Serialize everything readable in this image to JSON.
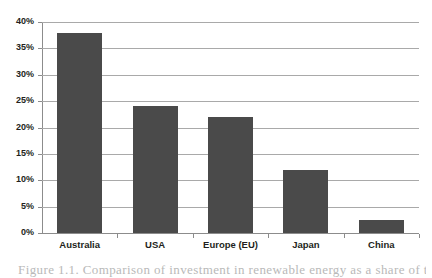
{
  "chart_data": {
    "type": "bar",
    "title": "",
    "xlabel": "",
    "ylabel": "",
    "categories": [
      "Australia",
      "USA",
      "Europe (EU)",
      "Japan",
      "China"
    ],
    "values": [
      38,
      24,
      22,
      12,
      2.5
    ],
    "value_labels": [
      "38%",
      "24%",
      "22%",
      "12%",
      "2.5%"
    ],
    "ylim": [
      0,
      40
    ],
    "ytick_values": [
      0,
      5,
      10,
      15,
      20,
      25,
      30,
      35,
      40
    ],
    "ytick_labels": [
      "0%",
      "5%",
      "10%",
      "15%",
      "20%",
      "25%",
      "30%",
      "35%",
      "40%"
    ],
    "grid": "horizontal",
    "legend": "none",
    "bar_color": "#4a4a4a",
    "gridline_color": "#a9a9a9",
    "axis_color": "#8c8c8c",
    "background_color": "#ffffff",
    "text_color": "#231f20"
  },
  "caption": {
    "text": "Figure 1.1. Comparison of investment in renewable energy as a share of total energy"
  }
}
